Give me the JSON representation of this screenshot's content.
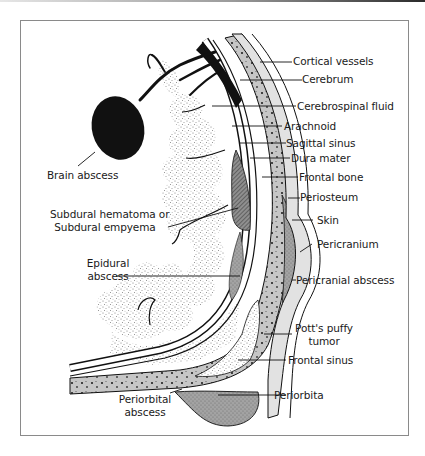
{
  "figure": {
    "type": "anatomical-illustration",
    "colors": {
      "frame_border": "#8a8a8a",
      "bone": "#c9c9c9",
      "abscess_fill": "#9b9b9b",
      "brain_stipple": "#d8d8d8",
      "ink": "#111111",
      "skin": "#e4e4e4"
    },
    "labels": {
      "cortical_vessels": "Cortical vessels",
      "cerebrum": "Cerebrum",
      "cerebrospinal_fluid": "Cerebrospinal fluid",
      "arachnoid": "Arachnoid",
      "sagittal_sinus": "Sagittal sinus",
      "dura_mater": "Dura mater",
      "frontal_bone": "Frontal bone",
      "periosteum": "Periosteum",
      "skin": "Skin",
      "pericranium": "Pericranium",
      "pericranial_abscess": "Pericranial abscess",
      "potts_puffy_tumor_line1": "Pott's puffy",
      "potts_puffy_tumor_line2": "tumor",
      "frontal_sinus": "Frontal sinus",
      "periorbita": "Periorbita",
      "periorbital_abscess_line1": "Periorbital",
      "periorbital_abscess_line2": "abscess",
      "brain_abscess": "Brain abscess",
      "subdural_line1": "Subdural hematoma or",
      "subdural_line2": "Subdural empyema",
      "epidural_line1": "Epidural",
      "epidural_line2": "abscess"
    }
  }
}
